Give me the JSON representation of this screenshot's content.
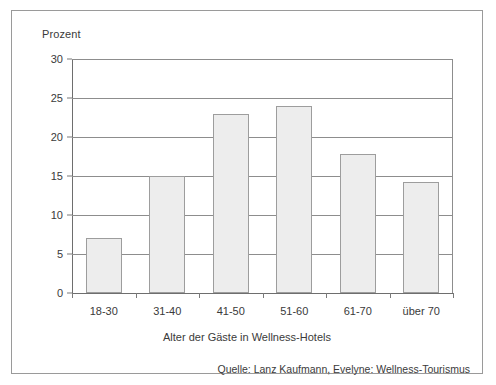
{
  "chart_data": {
    "type": "bar",
    "title": "",
    "subtitle": "",
    "categories": [
      "18-30",
      "31-40",
      "41-50",
      "51-60",
      "61-70",
      "über 70"
    ],
    "values": [
      7,
      15,
      23,
      24,
      17.8,
      14.2
    ],
    "series": [
      {
        "name": "Anteil der Gäste",
        "values": [
          7,
          15,
          23,
          24,
          17.8,
          14.2
        ]
      }
    ],
    "xlabel": "Alter der Gäste in Wellness-Hotels",
    "ylabel": "Prozent",
    "ylim": [
      0,
      30
    ],
    "yticks": [
      0,
      5,
      10,
      15,
      20,
      25,
      30
    ],
    "ytick_labels": [
      "0",
      "5",
      "10",
      "15",
      "20",
      "25",
      "30"
    ],
    "grid": true,
    "grid_axis": "y",
    "legend": false,
    "legend_position": "none",
    "annotations": [
      "Quelle: Lanz Kaufmann, Evelyne: Wellness-Tourismus"
    ],
    "bar_fill_color": "#ededed",
    "bar_edge_color": "#9d9d9d",
    "grid_color": "#8d8d8d",
    "axis_color": "#6e6e6e",
    "text_color": "#3a3a3a",
    "background_color": "#ffffff",
    "frame_border_color": "#9a9a9a"
  },
  "figure": {
    "y_axis_title": "Prozent",
    "x_axis_title": "Alter der Gäste in Wellness-Hotels",
    "source_note": "Quelle: Lanz Kaufmann, Evelyne: Wellness-Tourismus"
  }
}
